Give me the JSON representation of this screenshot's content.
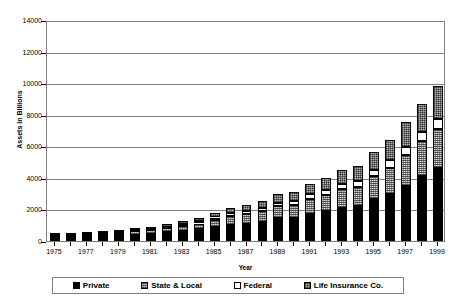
{
  "chart_data": {
    "type": "bar",
    "subtype": "stacked-column",
    "title": "",
    "xlabel": "Year",
    "ylabel": "Assets in Billions",
    "ylim": [
      0,
      14000
    ],
    "ytick_step": 2000,
    "yticks": [
      "0",
      "2000",
      "4000",
      "6000",
      "8000",
      "10000",
      "12000",
      "14000"
    ],
    "grid": true,
    "grid_axis": "y",
    "legend_position": "bottom",
    "categories": [
      "1975",
      "1976",
      "1977",
      "1978",
      "1979",
      "1980",
      "1981",
      "1982",
      "1983",
      "1984",
      "1985",
      "1986",
      "1987",
      "1988",
      "1989",
      "1990",
      "1991",
      "1992",
      "1993",
      "1994",
      "1995",
      "1996",
      "1997",
      "1998",
      "1999"
    ],
    "xtick_labels": [
      "1975",
      "1977",
      "1979",
      "1981",
      "1983",
      "1985",
      "1987",
      "1989",
      "1991",
      "1993",
      "1995",
      "1997",
      "1999"
    ],
    "series": [
      {
        "name": "Private",
        "color": "#000000",
        "pattern": "solid-black",
        "values": [
          212,
          240,
          272,
          305,
          350,
          412,
          470,
          560,
          660,
          750,
          900,
          1040,
          1100,
          1220,
          1430,
          1470,
          1730,
          1900,
          2100,
          2200,
          2640,
          3000,
          3500,
          4100,
          4600
        ]
      },
      {
        "name": "State & Local",
        "color": "#9a9a9a",
        "pattern": "fine-crosshatch",
        "values": [
          105,
          120,
          135,
          152,
          170,
          198,
          225,
          260,
          310,
          360,
          440,
          530,
          590,
          660,
          760,
          800,
          930,
          1030,
          1170,
          1240,
          1450,
          1650,
          1950,
          2220,
          2500
        ]
      },
      {
        "name": "Federal",
        "color": "#ffffff",
        "pattern": "solid-white",
        "values": [
          36,
          42,
          48,
          55,
          62,
          72,
          82,
          95,
          110,
          128,
          150,
          175,
          195,
          215,
          245,
          260,
          295,
          320,
          355,
          375,
          420,
          460,
          520,
          580,
          640
        ]
      },
      {
        "name": "Life Insurance Co.",
        "color": "#b4b4b4",
        "pattern": "coarse-crosshatch",
        "values": [
          60,
          70,
          80,
          92,
          105,
          122,
          140,
          165,
          200,
          235,
          290,
          350,
          400,
          460,
          540,
          580,
          680,
          770,
          880,
          950,
          1120,
          1300,
          1550,
          1800,
          2060
        ]
      }
    ],
    "totals": [
      413,
      472,
      535,
      604,
      687,
      804,
      917,
      1080,
      1280,
      1473,
      1780,
      2095,
      2285,
      2555,
      2975,
      3110,
      3635,
      4020,
      4505,
      4765,
      5630,
      6410,
      7520,
      8700,
      9800
    ]
  },
  "legend": {
    "items": [
      {
        "label": "Private"
      },
      {
        "label": "State & Local"
      },
      {
        "label": "Federal"
      },
      {
        "label": "Life Insurance Co."
      }
    ]
  }
}
